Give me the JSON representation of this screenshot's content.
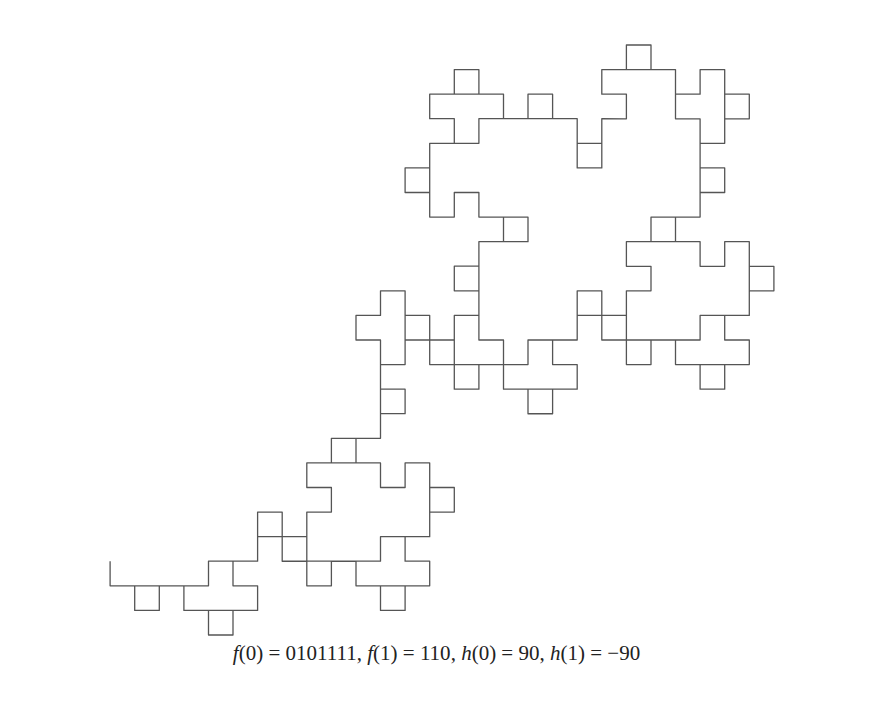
{
  "figure": {
    "type": "fractal-curve",
    "stroke_color": "#555555",
    "substitution": {
      "f0": "0101111",
      "f1": "110"
    },
    "angles": {
      "h0": 90,
      "h1": -90
    },
    "iterations": 4
  },
  "caption": {
    "text": "f(0) = 0101111, f(1) = 110, h(0) = 90, h(1) = −90",
    "parts": [
      {
        "fn": "f",
        "arg": "0",
        "val": "0101111"
      },
      {
        "fn": "f",
        "arg": "1",
        "val": "110"
      },
      {
        "fn": "h",
        "arg": "0",
        "val": "90"
      },
      {
        "fn": "h",
        "arg": "1",
        "val": "−90"
      }
    ]
  }
}
